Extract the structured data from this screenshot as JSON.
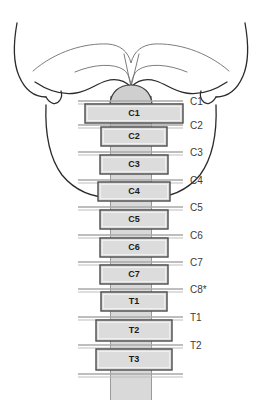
{
  "figure": {
    "colors": {
      "vertebra_fill": "#dcdcdc",
      "vertebra_stroke": "#4a4a4a",
      "cord_fill": "#d9d9d9",
      "outline_stroke": "#2b2b2b",
      "nerve_line": "#a8a8a8",
      "label_text": "#3b3b3b",
      "background": "#ffffff"
    }
  },
  "vertebrae": [
    {
      "label": "C1",
      "x": 85,
      "y": 104,
      "w": 98,
      "h": 19
    },
    {
      "label": "C2",
      "x": 101,
      "y": 127,
      "w": 66,
      "h": 19
    },
    {
      "label": "C3",
      "x": 100,
      "y": 155,
      "w": 68,
      "h": 19
    },
    {
      "label": "C4",
      "x": 98,
      "y": 182,
      "w": 72,
      "h": 19
    },
    {
      "label": "C5",
      "x": 100,
      "y": 210,
      "w": 68,
      "h": 19
    },
    {
      "label": "C6",
      "x": 100,
      "y": 238,
      "w": 68,
      "h": 19
    },
    {
      "label": "C7",
      "x": 100,
      "y": 265,
      "w": 68,
      "h": 19
    },
    {
      "label": "T1",
      "x": 101,
      "y": 292,
      "w": 66,
      "h": 19
    },
    {
      "label": "T2",
      "x": 96,
      "y": 320,
      "w": 76,
      "h": 21
    },
    {
      "label": "T3",
      "x": 96,
      "y": 349,
      "w": 76,
      "h": 21
    }
  ],
  "nerve_levels": [
    {
      "label": "C1",
      "y": 101,
      "label_x": 190,
      "line_x1": 78,
      "line_x2": 183
    },
    {
      "label": "C2",
      "y": 125,
      "label_x": 190,
      "line_x1": 78,
      "line_x2": 183
    },
    {
      "label": "C3",
      "y": 152,
      "label_x": 190,
      "line_x1": 78,
      "line_x2": 183
    },
    {
      "label": "C4",
      "y": 180,
      "label_x": 190,
      "line_x1": 78,
      "line_x2": 183
    },
    {
      "label": "C5",
      "y": 207,
      "label_x": 190,
      "line_x1": 78,
      "line_x2": 183
    },
    {
      "label": "C6",
      "y": 235,
      "label_x": 190,
      "line_x1": 78,
      "line_x2": 183
    },
    {
      "label": "C7",
      "y": 262,
      "label_x": 190,
      "line_x1": 78,
      "line_x2": 183
    },
    {
      "label": "C8*",
      "y": 289,
      "label_x": 190,
      "line_x1": 78,
      "line_x2": 183
    },
    {
      "label": "T1",
      "y": 317,
      "label_x": 190,
      "line_x1": 78,
      "line_x2": 183
    },
    {
      "label": "T2",
      "y": 345,
      "label_x": 190,
      "line_x1": 78,
      "line_x2": 183
    },
    {
      "label": "",
      "y": 374,
      "label_x": 190,
      "line_x1": 78,
      "line_x2": 183
    }
  ]
}
